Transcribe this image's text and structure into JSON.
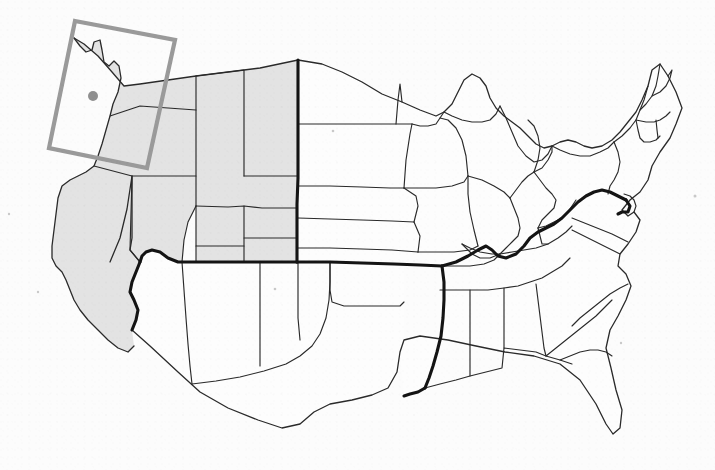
{
  "image": {
    "kind": "map",
    "title": "Map of the contiguous United States",
    "width": 715,
    "height": 470,
    "background_color": "#fcfcfc"
  },
  "legend": {
    "shaded_region_label": "Shaded western states",
    "bold_boundary_label": "Bold regional boundary",
    "highlight_label": "Highlighted inset region",
    "marker_label": "Location marker"
  },
  "colors": {
    "shaded_fill": "#e3e3e3",
    "plain_fill": "#fdfdfd",
    "thin_border": "#2a2a2a",
    "bold_border": "#141414",
    "highlight_stroke": "#9a9a9a",
    "marker_fill": "#8f8f8f"
  },
  "highlight_box": {
    "name": "pacific-northwest-highlight",
    "rotation_degrees": 10,
    "corners": [
      [
        75,
        21
      ],
      [
        175,
        40
      ],
      [
        147,
        168
      ],
      [
        49,
        148
      ]
    ]
  },
  "marker": {
    "name": "location-marker",
    "x": 93,
    "y": 96,
    "radius": 5
  },
  "shaded_states": [
    "Washington",
    "Oregon",
    "California",
    "Nevada",
    "Idaho",
    "Montana",
    "Wyoming",
    "Utah",
    "Colorado"
  ],
  "plain_states": [
    "Arizona",
    "New Mexico",
    "Texas",
    "Oklahoma",
    "Kansas",
    "Nebraska",
    "South Dakota",
    "North Dakota",
    "Minnesota",
    "Iowa",
    "Missouri",
    "Arkansas",
    "Louisiana",
    "Mississippi",
    "Alabama",
    "Tennessee",
    "Kentucky",
    "Illinois",
    "Wisconsin",
    "Michigan",
    "Indiana",
    "Ohio",
    "West Virginia",
    "Virginia",
    "North Carolina",
    "South Carolina",
    "Georgia",
    "Florida",
    "Pennsylvania",
    "New York",
    "Maryland",
    "Delaware",
    "New Jersey",
    "Connecticut",
    "Rhode Island",
    "Massachusetts",
    "Vermont",
    "New Hampshire",
    "Maine"
  ],
  "geometry": {
    "national_outline": "M132 176 L127 209 L120 238 L110 262 L112 277 L129 296 L138 316 L132 330 L150 346 L178 372 L200 392 L228 408 L258 420 L282 428 L300 424 L314 412 L330 404 L352 400 L372 395 L388 388 L397 372 L400 352 L404 340 L420 336 L448 340 L476 346 L505 352 L534 356 L560 364 L580 380 L596 404 L606 424 L613 434 L620 428 L622 410 L616 390 L611 368 L606 348 L610 330 L618 316 L626 300 L631 286 L626 274 L618 266 L620 254 L628 244 L636 232 L640 220 L634 212 L628 216 L622 210 L630 200 L640 192 L648 180 L652 166 L660 152 L670 138 L676 124 L682 108 L676 92 L668 76 L660 64 L652 70 L648 86 L642 100 L636 112 L628 122 L620 132 L612 140 L602 146 L592 148 L584 146 L576 142 L568 140 L560 142 L552 146 L544 148 L536 144 L528 136 L520 128 L512 122 L504 116 L496 108 L490 98 L486 86 L480 78 L472 74 L464 80 L458 92 L452 104 L444 112 L436 116 L428 114 L420 110 L412 106 L402 102 L392 98 L382 94 L372 88 L362 82 L352 76 L342 72 L332 68 L322 64 L312 62 L302 60 L294 62 L286 64 L274 66 L260 68 L244 70 L228 72 L212 74 L196 76 L182 78 L168 80 L156 82 L146 84 L140 92 L136 106 L133 126 L132 150 Z",
    "pacific_coast": "M132 176 L127 209 L120 238 L110 262 L112 277 L129 296 L138 316 L132 330",
    "northwest_coast": "M74 38 L80 46 L86 52 L94 50 L96 42 L100 40 L102 50 L104 62 L108 66 L113 62 L118 66 L120 78 L118 92 L113 104 L108 116 L104 130 L100 144 L96 156 L92 166 L86 172 L78 176 L70 180 L62 186 L58 198 L56 214 L54 230 L52 246 L52 258 L56 266 L62 272 L66 280 L70 290 L74 300 L80 310 L88 320 L98 330 L108 340 L118 348 L128 352 L134 346",
    "bold_paths": [
      "M298 60 L298 92 L298 124 L298 154 L298 186 L298 218 L298 248 L298 262",
      "M296 262 L276 262 L254 262 L232 262 L210 262 L190 262 L176 262 L166 258 L160 252 L152 250 L146 252 L142 256 L140 262",
      "M140 262 L136 272 L132 282 L130 292 L134 300 L138 310 L136 320 L132 330",
      "M298 262 L330 262 L362 263 L394 264 L420 265 L442 266",
      "M442 266 L444 282 L444 300 L443 318 L441 336 L437 352 L433 366 L429 378 L425 388",
      "M425 388 L418 392 L410 394 L404 396",
      "M442 266 L456 262 L468 256 L478 250 L486 246 L492 250 L498 256 L506 258 L516 254 L524 246 L530 238 L538 232 L546 228 L554 224 L562 218 L570 210 L578 202 L586 196 L594 192 L602 190 L610 192 L618 196 L626 200",
      "M626 200 L630 206 L628 212 L622 212 L618 214"
    ],
    "thin_paths": [
      "M196 76 L196 110 L196 142 L196 176 L196 206",
      "M132 176 L166 176 L196 176",
      "M196 176 L228 176 L260 176 L290 176 L298 176",
      "M196 206 L228 207 L262 208 L296 208",
      "M132 176 L132 206 L132 238 L130 250",
      "M196 206 L190 214 L186 226 L184 240 L182 254 L180 262",
      "M196 110 L168 108 L140 106 L136 106",
      "M298 124 L330 124 L364 124 L396 124 L412 124",
      "M298 186 L330 186 L362 187 L390 188 L404 188",
      "M298 218 L330 219 L362 220 L392 221 L414 222",
      "M298 248 L330 248 L362 249 L392 250 L418 252",
      "M396 124 L398 92 L400 76",
      "M404 188 L406 156 L410 128 L412 124",
      "M414 222 L416 204 L418 190 L404 188",
      "M418 252 L420 236 L414 222",
      "M442 266 L446 248 L450 232 L452 216 L450 202 L446 192 L440 186 L434 178 L430 168 L428 156 L430 144 L434 134 L438 126 L440 118",
      "M440 118 L452 118 L466 120 L478 124 L490 128 L500 130",
      "M466 120 L466 138 L468 156 L472 172 L478 184 L484 192 L492 196 L500 196 L506 192",
      "M506 192 L512 198 L518 206 L524 212 L530 216 L534 222 L532 230 L528 238 L524 246",
      "M500 130 L504 140 L506 152 L508 164 L512 176 L518 184 L524 190 L530 194 L536 196 L542 196 L548 194 L552 190",
      "M552 190 L558 196 L562 204 L566 212 L570 210",
      "M506 192 L512 186 L518 182 L524 180 L530 182 L536 186 L542 190 L548 194",
      "M425 388 L440 382 L456 378 L472 374 L488 370 L502 366 L514 362 L524 358 L534 356",
      "M470 374 L472 358 L474 342 L476 330 L480 320 L486 314 L492 310 L500 308",
      "M500 308 L510 302 L520 296 L528 290 L536 284 L544 280 L552 276 L560 272 L566 266 L570 258 L572 248 L570 238 L566 230",
      "M500 308 L504 322 L508 336 L512 348 L516 356 L520 364 L522 372 L524 380",
      "M524 380 L534 376 L544 372 L554 368 L562 364 L570 360 L578 358 L586 358 L592 362",
      "M524 358 L528 346 L532 336 L538 328 L546 322 L554 318 L562 314 L570 310 L578 304 L586 298 L594 292 L602 286 L610 282 L618 280 L626 280",
      "M556 316 L558 330 L560 344 L562 356 L562 364",
      "M592 362 L598 378 L604 396 L608 414 L613 434",
      "M388 388 L394 376 L400 364 L404 352 L400 352",
      "M244 70 L244 100 L244 124 L244 146 L244 170 L244 176",
      "M260 176 L260 204 L260 230 L260 252 L260 262",
      "M330 68 L330 96 L330 124",
      "M364 124 L366 96 L368 80 L370 72",
      "M330 124 L330 156 L330 186",
      "M362 187 L364 158 L366 140 L364 124",
      "M362 187 L362 218 L362 248",
      "M330 186 L330 218 L330 248",
      "M480 78 L482 94 L486 108 L490 120 L490 128",
      "M440 118 L436 106 L432 96 L430 86 L432 76 L436 70 L444 66",
      "M196 142 L228 144 L244 146",
      "M244 146 L260 146 L276 148 L290 150 L298 154",
      "M132 238 L150 240 L166 242 L180 244 L196 246",
      "M196 206 L196 238 L196 246",
      "M196 246 L196 262",
      "M244 176 L244 206 L244 238 L244 262",
      "M182 254 L184 286 L186 318 L188 344 L190 366 L192 384",
      "M192 384 L208 382 L224 380 L240 376 L256 372 L272 368 L286 364 L298 358 L308 350 L316 340 L322 330 L326 318 L328 304 L330 290 L330 276 L330 262",
      "M260 262 L260 290 L260 318 L260 344 L260 366",
      "M298 262 L298 290 L298 318 L298 340"
    ],
    "state_shapes_shaded": [
      "M74 38 L80 46 L86 52 L94 50 L96 42 L100 40 L102 50 L104 62 L108 66 L113 62 L118 66 L120 78 L118 92 L113 104 L110 116 L140 106 L168 108 L196 110 L196 76 L168 80 L140 84 L124 86 L112 72 L98 56 L84 44 Z",
      "M110 116 L106 130 L102 144 L98 156 L94 166 L132 176 L166 176 L196 176 L196 110 L168 108 L140 106 Z",
      "M94 166 L86 172 L78 176 L70 180 L62 186 L58 198 L56 214 L54 230 L52 246 L52 258 L56 266 L62 272 L66 280 L70 290 L74 300 L80 310 L88 320 L98 330 L108 340 L118 348 L128 352 L134 346 L132 330 L136 320 L138 310 L134 300 L130 292 L132 282 L136 272 L140 262 L130 250 L132 238 L132 206 L132 176 Z",
      "M132 176 L130 250 L140 262 L142 256 L146 252 L152 250 L160 252 L166 258 L176 262 L180 262 L182 254 L184 240 L186 226 L190 214 L196 206 L196 176 L166 176 Z",
      "M196 76 L196 110 L196 142 L196 176 L196 206 L228 207 L262 208 L296 208 L298 186 L298 154 L298 124 L298 92 L298 60 L260 68 L228 72 L212 74 Z",
      "M196 206 L196 246 L244 262 L260 262 L296 262 L298 248 L298 218 L296 208 L262 208 L228 207 Z",
      "M196 246 L196 262 L210 262 L232 262 L244 262 Z",
      "M182 254 L180 262 L190 262 L196 262 L196 246 L180 244 Z"
    ]
  },
  "specks": [
    {
      "x": 333,
      "y": 131
    },
    {
      "x": 275,
      "y": 289
    },
    {
      "x": 695,
      "y": 196
    },
    {
      "x": 38,
      "y": 292
    },
    {
      "x": 621,
      "y": 343
    },
    {
      "x": 9,
      "y": 214
    }
  ]
}
